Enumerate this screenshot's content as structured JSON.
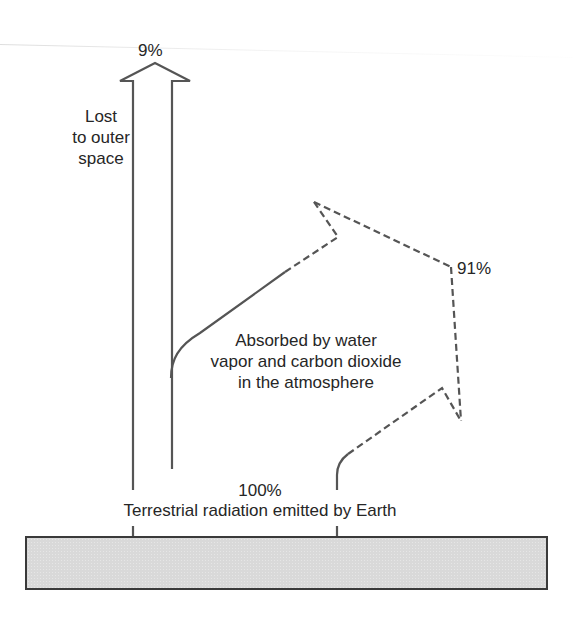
{
  "diagram": {
    "colors": {
      "line": "#555555",
      "earth_fill": "#d9d9d9",
      "earth_border": "#3a3a3a",
      "text": "#262626"
    },
    "labels": {
      "lost_percent": "9%",
      "lost_line1": "Lost",
      "lost_line2": "to outer",
      "lost_line3": "space",
      "absorbed_percent": "91%",
      "absorbed_line1": "Absorbed by water",
      "absorbed_line2": "vapor and carbon dioxide",
      "absorbed_line3": "in the atmosphere",
      "emitted_percent": "100%",
      "emitted_caption": "Terrestrial radiation emitted by Earth"
    },
    "flows": [
      {
        "name": "lost-to-space",
        "percent": 9,
        "style": "solid-outline-arrow"
      },
      {
        "name": "absorbed-by-atmosphere",
        "percent": 91,
        "style": "dashed-arrows"
      },
      {
        "name": "emitted-by-earth",
        "percent": 100,
        "style": "source"
      }
    ]
  }
}
